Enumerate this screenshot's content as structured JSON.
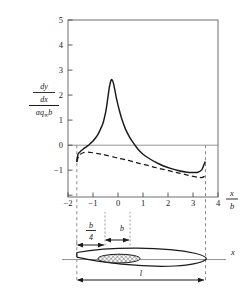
{
  "figure": {
    "kind": "aerodynamic-slope-distribution-with-airfoil-schematic"
  },
  "axes": {
    "x": {
      "label_numerator": "x",
      "label_denominator": "b",
      "ticks": [
        -2,
        -1,
        0,
        1,
        2,
        3,
        4
      ],
      "tick_labels": [
        "−2",
        "−1",
        "0",
        "1",
        "2",
        "3",
        "4"
      ],
      "min": -2,
      "max": 4
    },
    "y": {
      "label_numerator_1": "d",
      "label_numerator_2": "y",
      "label_denominator_1": "d",
      "label_denominator_2": "x",
      "label_lower_1": "αq",
      "label_lower_sub": "∞",
      "label_lower_2": "b",
      "ticks": [
        -1,
        0,
        1,
        2,
        3,
        4,
        5
      ],
      "tick_labels": [
        "−1",
        "0",
        "1",
        "2",
        "3",
        "4",
        "5"
      ],
      "min": -1,
      "max": 5
    }
  },
  "guides": {
    "left_dashed_x": -1.65,
    "right_dashed_x": 3.5
  },
  "schematic": {
    "axis_label": "x",
    "dim_b_over_4_num": "b",
    "dim_b_over_4_den": "4",
    "dim_b": "b",
    "dim_length": "l"
  },
  "chart_data": {
    "type": "line",
    "title": "",
    "xlabel": "x/b",
    "ylabel": "(dy/dx)/(αq∞b)",
    "xlim": [
      -2,
      4
    ],
    "ylim": [
      -1,
      5
    ],
    "grid": false,
    "legend": "none",
    "series": [
      {
        "name": "solid-curve",
        "style": "solid",
        "color": "#1a1a1a",
        "x": [
          -1.65,
          -1.6,
          -1.5,
          -1.4,
          -1.3,
          -1.2,
          -1.1,
          -1.0,
          -0.9,
          -0.8,
          -0.7,
          -0.6,
          -0.5,
          -0.45,
          -0.4,
          -0.35,
          -0.3,
          -0.27,
          -0.25,
          -0.22,
          -0.18,
          -0.12,
          -0.05,
          0.05,
          0.15,
          0.3,
          0.45,
          0.6,
          0.8,
          1.0,
          1.2,
          1.5,
          1.8,
          2.1,
          2.4,
          2.7,
          3.0,
          3.2,
          3.35,
          3.42,
          3.47,
          3.5
        ],
        "y": [
          0.18,
          0.45,
          0.55,
          0.62,
          0.68,
          0.74,
          0.82,
          0.9,
          1.0,
          1.12,
          1.3,
          1.5,
          1.85,
          2.1,
          2.4,
          2.7,
          2.9,
          2.97,
          2.98,
          2.95,
          2.85,
          2.6,
          2.3,
          1.95,
          1.65,
          1.3,
          1.05,
          0.85,
          0.62,
          0.45,
          0.33,
          0.18,
          0.06,
          -0.03,
          -0.1,
          -0.15,
          -0.17,
          -0.16,
          -0.08,
          0.05,
          0.16,
          0.2
        ]
      },
      {
        "name": "dashed-curve",
        "style": "dashed",
        "color": "#1a1a1a",
        "x": [
          -1.65,
          -1.55,
          -1.4,
          -1.2,
          -1.0,
          -0.8,
          -0.6,
          -0.4,
          -0.2,
          0.0,
          0.3,
          0.6,
          0.9,
          1.2,
          1.5,
          1.8,
          2.1,
          2.4,
          2.7,
          3.0,
          3.2,
          3.35,
          3.45,
          3.5
        ],
        "y": [
          0.2,
          0.42,
          0.5,
          0.52,
          0.5,
          0.47,
          0.44,
          0.4,
          0.36,
          0.32,
          0.26,
          0.2,
          0.13,
          0.07,
          0.0,
          -0.06,
          -0.12,
          -0.18,
          -0.24,
          -0.3,
          -0.33,
          -0.34,
          -0.3,
          -0.26
        ]
      }
    ]
  }
}
